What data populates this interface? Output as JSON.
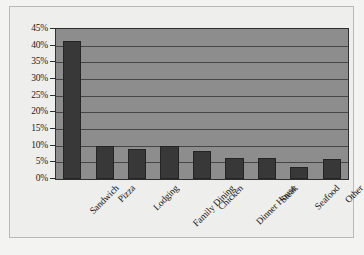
{
  "chart_data": {
    "type": "bar",
    "title": "",
    "subtitle": "",
    "xlabel": "",
    "ylabel": "",
    "categories": [
      "Sandwich",
      "Pizza",
      "Lodging",
      "Family Dining",
      "Chicken",
      "Dinner House",
      "Steak",
      "Seafood",
      "Other"
    ],
    "values": [
      41.5,
      10.0,
      9.0,
      10.0,
      8.3,
      6.2,
      6.2,
      3.5,
      6.0
    ],
    "value_unit": "%",
    "ylim": [
      0,
      45
    ],
    "ytick_step": 5,
    "ytick_labels": [
      "0%",
      "5%",
      "10%",
      "15%",
      "20%",
      "25%",
      "30%",
      "35%",
      "40%",
      "45%"
    ],
    "ytick_values": [
      0,
      5,
      10,
      15,
      20,
      25,
      30,
      35,
      40,
      45
    ],
    "grid": true,
    "grid_axis": "y",
    "legend": false,
    "legend_position": "none",
    "series": [
      {
        "name": "Share",
        "values": [
          41.5,
          10.0,
          9.0,
          10.0,
          8.3,
          6.2,
          6.2,
          3.5,
          6.0
        ]
      }
    ],
    "xtick_label_rotation": -45,
    "colors": {
      "bar_fill": "#383838",
      "bar_border": "#242424",
      "plot_background": "#8d8d8d",
      "plot_border": "#2f2f2f",
      "gridline": "#3a3a3a",
      "figure_background": "#eeeeec",
      "figure_border": "#b9b9b7",
      "tick_text": "#1a1a1a"
    }
  }
}
